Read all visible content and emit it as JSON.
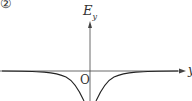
{
  "figure": {
    "panel_label": "②",
    "vertical_axis_label": "E",
    "vertical_axis_subscript": "y",
    "horizontal_axis_label": "y",
    "origin_label": "O",
    "curve_description": "symmetric curve approaching zero from below far from origin, dipping steeply downward near the origin on both sides"
  },
  "colors": {
    "axis": "#444444",
    "curve": "#222222",
    "background": "#ffffff"
  }
}
